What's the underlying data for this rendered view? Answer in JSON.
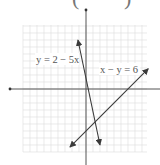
{
  "chart_data": {
    "type": "line",
    "title": "",
    "xlabel": "",
    "ylabel": "",
    "grid": true,
    "xlim": [
      -9,
      9
    ],
    "ylim": [
      -9,
      9
    ],
    "origin_px": [
      86,
      89
    ],
    "scale_px_per_unit": 7,
    "series": [
      {
        "name": "y = 2 − 5x",
        "equation": "y = 2 - 5x",
        "x": [
          -1.15,
          2.0
        ],
        "y": [
          7.0,
          -8.0
        ],
        "arrows": "both"
      },
      {
        "name": "x − y = 6",
        "equation": "x - y = 6",
        "x": [
          -2.3,
          8.9
        ],
        "y": [
          -8.3,
          2.9
        ],
        "arrows": "both"
      }
    ],
    "annotations": [
      {
        "text": "y = 2 − 5x",
        "near": "left of y-axis, upper"
      },
      {
        "text": "x − y = 6",
        "near": "right of y-axis, upper"
      }
    ],
    "intersection": {
      "x": 1.14,
      "y": -4.86
    }
  },
  "labels": {
    "line1": "y = 2 − 5x",
    "line2": "x − y = 6",
    "paren_left": "(",
    "paren_right": ")"
  },
  "colors": {
    "grid": "#dcdcdc",
    "axis": "#555555",
    "line": "#3a3a3a",
    "text": "#555555"
  }
}
